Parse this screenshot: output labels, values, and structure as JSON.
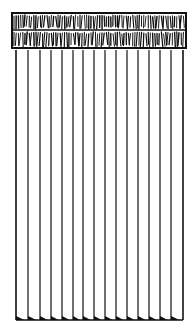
{
  "illustration": {
    "subject": "vertical blinds with decorative valance",
    "colors": {
      "ink": "#111111",
      "background": "#ffffff"
    },
    "valance": {
      "x1": 12,
      "x2": 186,
      "top": 13,
      "divider": 30,
      "bottom": 48
    },
    "slats": {
      "top": 50,
      "bottom": 320,
      "positions": [
        16,
        28,
        40,
        51,
        62,
        73,
        83,
        94,
        105,
        116,
        127,
        138,
        149,
        160,
        171,
        183
      ]
    }
  }
}
